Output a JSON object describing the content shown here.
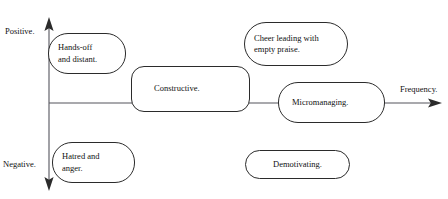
{
  "diagram": {
    "type": "quadrant-scatter-diagram",
    "axes": {
      "vertical": {
        "positive_label": "Positive.",
        "negative_label": "Negative.",
        "x": 49,
        "top_y": 18,
        "bottom_y": 190,
        "arrowheads": "both"
      },
      "horizontal": {
        "label": "Frequency.",
        "y": 103,
        "left_x": 49,
        "right_x": 441,
        "arrowheads": "right"
      },
      "origin": {
        "x": 49,
        "y": 103
      }
    },
    "line_color": "#2b2b2b",
    "text_color": "#111111",
    "background": "#ffffff",
    "nodes": [
      {
        "id": "hands-off",
        "label": "Hands-off\nand distant.",
        "align": "left",
        "quadrant": "upper-left",
        "frequency": "low",
        "sentiment": "positive"
      },
      {
        "id": "constructive",
        "label": "Constructive.",
        "align": "left",
        "quadrant": "straddles-axis",
        "frequency": "medium",
        "sentiment": "neutral"
      },
      {
        "id": "cheer-leading",
        "label": "Cheer leading with\nempty praise.",
        "align": "left",
        "quadrant": "upper-right",
        "frequency": "high",
        "sentiment": "positive"
      },
      {
        "id": "micromanaging",
        "label": "Micromanaging.",
        "align": "left",
        "quadrant": "straddles-axis",
        "frequency": "very-high",
        "sentiment": "neutral"
      },
      {
        "id": "hatred-anger",
        "label": "Hatred and\nanger.",
        "align": "left",
        "quadrant": "lower-left",
        "frequency": "low",
        "sentiment": "negative"
      },
      {
        "id": "demotivating",
        "label": "Demotivating.",
        "align": "center",
        "quadrant": "lower-right",
        "frequency": "high",
        "sentiment": "negative"
      }
    ]
  }
}
